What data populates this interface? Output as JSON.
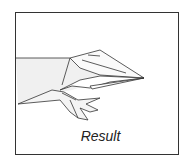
{
  "diagram": {
    "caption": "Result",
    "colors": {
      "line": "#333333",
      "fill": "#f0f0f0",
      "frame": "#333333"
    }
  }
}
